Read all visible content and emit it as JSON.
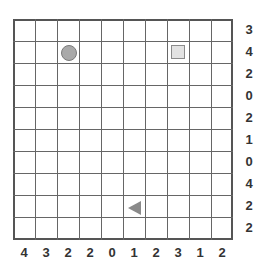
{
  "puzzle": {
    "grid_size": {
      "rows": 10,
      "cols": 10
    },
    "row_clues": [
      "3",
      "4",
      "2",
      "0",
      "2",
      "1",
      "0",
      "4",
      "2",
      "2"
    ],
    "col_clues": [
      "4",
      "3",
      "2",
      "2",
      "0",
      "1",
      "2",
      "3",
      "1",
      "2"
    ],
    "pieces": [
      {
        "type": "circle",
        "row": 1,
        "col": 2,
        "color": "#a9a9a9"
      },
      {
        "type": "square",
        "row": 1,
        "col": 7,
        "color": "#e2e2e2"
      },
      {
        "type": "triangle-left",
        "row": 8,
        "col": 5,
        "color": "#8a8a8a"
      }
    ]
  }
}
